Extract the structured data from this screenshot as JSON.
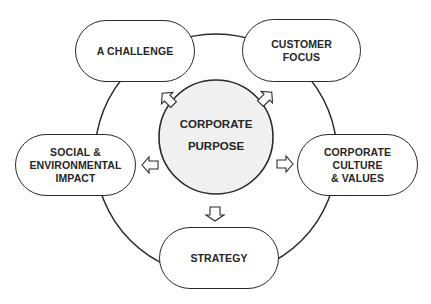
{
  "diagram": {
    "center": {
      "label": "CORPORATE\nPURPOSE",
      "fill": "#f0f0f0"
    },
    "nodes": [
      {
        "id": "challenge",
        "label": "A CHALLENGE"
      },
      {
        "id": "customer-focus",
        "label": "CUSTOMER\nFOCUS"
      },
      {
        "id": "social-environmental-impact",
        "label": "SOCIAL &\nENVIRONMENTAL\nIMPACT"
      },
      {
        "id": "corporate-culture-values",
        "label": "CORPORATE\nCULTURE\n& VALUES"
      },
      {
        "id": "strategy",
        "label": "STRATEGY"
      }
    ],
    "colors": {
      "stroke": "#2a2a2a",
      "text": "#262626",
      "background": "#ffffff"
    }
  }
}
